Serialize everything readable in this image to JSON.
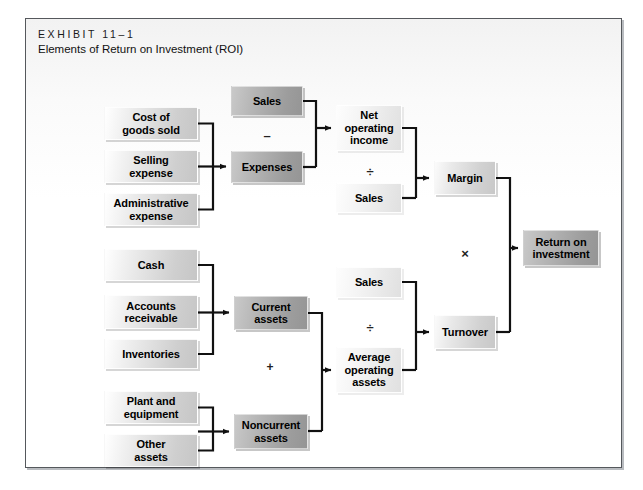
{
  "exhibit": {
    "label": "EXHIBIT 11–1",
    "title": "Elements of Return on Investment (ROI)"
  },
  "colors": {
    "frame_border": "#55585c",
    "page_background": "#ffffff",
    "panel_background": "#fbfbfb",
    "wire": "#111111",
    "box_light": "#e8e8e8",
    "box_pale": "#f2f2f2",
    "box_medium": "#dadada",
    "box_dark": "#a8a8a8",
    "text": "#000000"
  },
  "diagram": {
    "type": "flowchart",
    "nodes": [
      {
        "id": "cost-of-goods-sold",
        "label": "Cost of\ngoods sold",
        "tone": "light",
        "x": 78,
        "y": 88,
        "w": 94,
        "h": 33
      },
      {
        "id": "selling-expense",
        "label": "Selling\nexpense",
        "tone": "light",
        "x": 78,
        "y": 131,
        "w": 94,
        "h": 33
      },
      {
        "id": "administrative-expense",
        "label": "Administrative\nexpense",
        "tone": "light",
        "x": 78,
        "y": 174,
        "w": 94,
        "h": 33
      },
      {
        "id": "sales-top",
        "label": "Sales",
        "tone": "dark",
        "x": 205,
        "y": 67,
        "w": 72,
        "h": 30
      },
      {
        "id": "expenses",
        "label": "Expenses",
        "tone": "dark",
        "x": 205,
        "y": 132,
        "w": 72,
        "h": 32
      },
      {
        "id": "net-operating-income",
        "label": "Net\noperating\nincome",
        "tone": "pale",
        "x": 310,
        "y": 86,
        "w": 66,
        "h": 46
      },
      {
        "id": "sales-margin-denom",
        "label": "Sales",
        "tone": "pale",
        "x": 310,
        "y": 164,
        "w": 66,
        "h": 30
      },
      {
        "id": "margin",
        "label": "Margin",
        "tone": "medium",
        "x": 408,
        "y": 142,
        "w": 62,
        "h": 34
      },
      {
        "id": "return-on-investment",
        "label": "Return on\ninvestment",
        "tone": "dark",
        "x": 497,
        "y": 211,
        "w": 76,
        "h": 36
      },
      {
        "id": "cash",
        "label": "Cash",
        "tone": "light",
        "x": 78,
        "y": 230,
        "w": 94,
        "h": 32
      },
      {
        "id": "accounts-receivable",
        "label": "Accounts\nreceivable",
        "tone": "light",
        "x": 78,
        "y": 276,
        "w": 94,
        "h": 34
      },
      {
        "id": "inventories",
        "label": "Inventories",
        "tone": "light",
        "x": 78,
        "y": 320,
        "w": 94,
        "h": 30
      },
      {
        "id": "plant-and-equipment",
        "label": "Plant and\nequipment",
        "tone": "light",
        "x": 78,
        "y": 372,
        "w": 94,
        "h": 33
      },
      {
        "id": "other-assets",
        "label": "Other\nassets",
        "tone": "light",
        "x": 78,
        "y": 415,
        "w": 94,
        "h": 33
      },
      {
        "id": "current-assets",
        "label": "Current\nassets",
        "tone": "dark",
        "x": 208,
        "y": 277,
        "w": 74,
        "h": 34
      },
      {
        "id": "noncurrent-assets",
        "label": "Noncurrent\nassets",
        "tone": "dark",
        "x": 208,
        "y": 395,
        "w": 74,
        "h": 35
      },
      {
        "id": "sales-turnover-num",
        "label": "Sales",
        "tone": "pale",
        "x": 310,
        "y": 248,
        "w": 66,
        "h": 31
      },
      {
        "id": "average-operating-assets",
        "label": "Average\noperating\nassets",
        "tone": "pale",
        "x": 310,
        "y": 328,
        "w": 66,
        "h": 46
      },
      {
        "id": "turnover",
        "label": "Turnover",
        "tone": "medium",
        "x": 408,
        "y": 296,
        "w": 62,
        "h": 34
      }
    ],
    "operators": [
      {
        "id": "minus-sales-expenses",
        "symbol": "–",
        "x": 233,
        "y": 108
      },
      {
        "id": "divide-margin",
        "symbol": "÷",
        "x": 336,
        "y": 144
      },
      {
        "id": "multiply-margin-turnover",
        "symbol": "×",
        "x": 431,
        "y": 226
      },
      {
        "id": "divide-turnover",
        "symbol": "÷",
        "x": 336,
        "y": 300
      },
      {
        "id": "plus-current-noncurrent",
        "symbol": "+",
        "x": 236,
        "y": 340
      }
    ],
    "edges": [
      "cost-of-goods-sold → expenses",
      "selling-expense → expenses",
      "administrative-expense → expenses",
      "sales-top − expenses → net-operating-income",
      "net-operating-income ÷ sales → margin",
      "margin × turnover → return-on-investment",
      "cash → current-assets",
      "accounts-receivable → current-assets",
      "inventories → current-assets",
      "plant-and-equipment → noncurrent-assets",
      "other-assets → noncurrent-assets",
      "current-assets + noncurrent-assets → average-operating-assets",
      "sales ÷ average-operating-assets → turnover"
    ]
  }
}
